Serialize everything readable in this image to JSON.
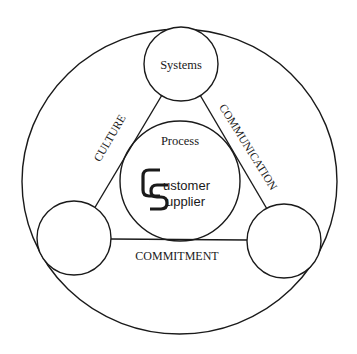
{
  "diagram": {
    "nodes": {
      "top": {
        "label": "Systems"
      },
      "center": {
        "label": "Process"
      },
      "left": {
        "label": ""
      },
      "right": {
        "label": ""
      }
    },
    "edges": {
      "left_edge": {
        "label": "CULTURE"
      },
      "right_edge": {
        "label": "COMMUNICATION"
      },
      "bottom_edge": {
        "label": "COMMITMENT"
      }
    },
    "logo": {
      "letter1": "C",
      "word1_rest": "ustomer",
      "letter2": "S",
      "word2_rest": "upplier"
    },
    "colors": {
      "line": "#1a1a1a",
      "background": "#ffffff"
    }
  }
}
